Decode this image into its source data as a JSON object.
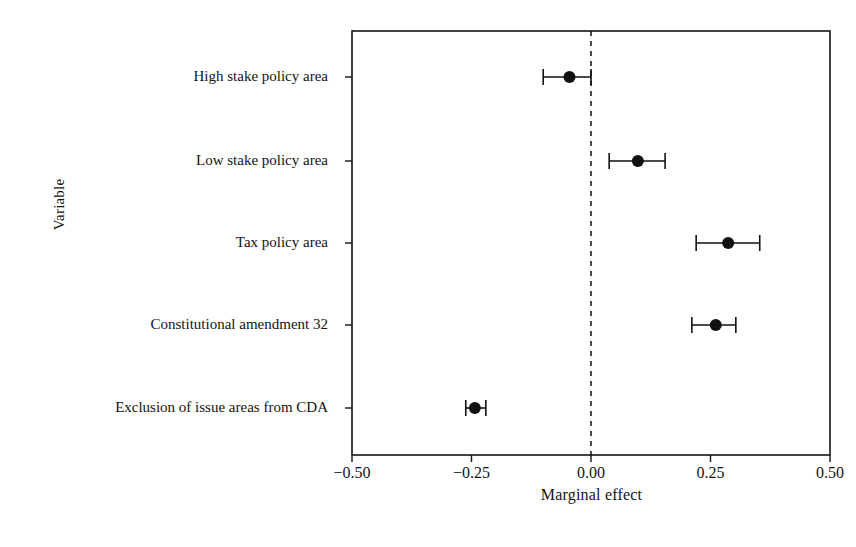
{
  "chart_data": {
    "type": "scatter",
    "subtype": "dot-and-whisker coefficient plot",
    "title": "",
    "xlabel": "Marginal effect",
    "ylabel": "Variable",
    "xlim": [
      -0.5,
      0.5
    ],
    "xticks": [
      -0.5,
      -0.25,
      0,
      0.25,
      0.5
    ],
    "xticklabels": [
      "−0.50",
      "−0.25",
      "0.00",
      "0.25",
      "0.50"
    ],
    "grid": false,
    "legend": null,
    "reference_line": {
      "value": 0.0,
      "style": "dashed",
      "orientation": "vertical"
    },
    "categories": [
      "High stake policy area",
      "Low stake policy area",
      "Tax policy area",
      "Constitutional amendment 32",
      "Exclusion of issue areas from CDA"
    ],
    "points": [
      {
        "label": "High stake policy area",
        "estimate": -0.045,
        "ci_low": -0.1,
        "ci_high": 0.0
      },
      {
        "label": "Low stake policy area",
        "estimate": 0.098,
        "ci_low": 0.038,
        "ci_high": 0.155
      },
      {
        "label": "Tax policy area",
        "estimate": 0.287,
        "ci_low": 0.22,
        "ci_high": 0.353
      },
      {
        "label": "Constitutional amendment 32",
        "estimate": 0.261,
        "ci_low": 0.211,
        "ci_high": 0.303
      },
      {
        "label": "Exclusion of issue areas from CDA",
        "estimate": -0.243,
        "ci_low": -0.262,
        "ci_high": -0.22
      }
    ],
    "marker": {
      "shape": "circle",
      "color": "#111111",
      "size": 7
    },
    "errorbar": {
      "color": "#111111",
      "capstyle": "flat"
    },
    "frame": {
      "color": "#141414",
      "visible": true
    }
  },
  "axes": {
    "x_title": "Marginal effect",
    "y_title": "Variable"
  },
  "colors": {
    "ink": "#111111",
    "frame": "#141414",
    "background": "#ffffff"
  }
}
